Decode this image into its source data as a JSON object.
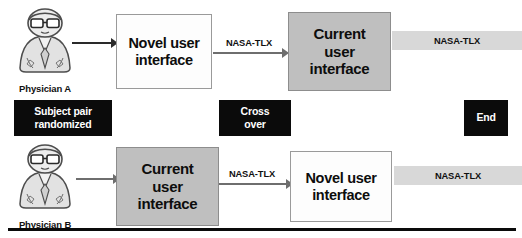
{
  "diagram": {
    "bottom_rule": true,
    "colors": {
      "shaded_box_fill": "#bfbfbf",
      "light_box_fill": "#fdfdfd",
      "box_border": "#9a9a9a",
      "black_box_fill": "#0b0b0b",
      "black_box_text": "#ffffff",
      "band_fill": "#d8d8d8",
      "arrow": "#6e6e6e",
      "rule": "#0a0a0a"
    }
  },
  "arm_a": {
    "person_label": "Physician A",
    "person_icon": "physician-avatar-icon",
    "step1": "Novel user\ninterface",
    "step1_line1": "Novel user",
    "step1_line2": "interface",
    "step1_style": "light",
    "measure1": "NASA-TLX",
    "step2_line1": "Current",
    "step2_line2": "user",
    "step2_line3": "interface",
    "step2_style": "shaded",
    "measure2": "NASA-TLX"
  },
  "arm_b": {
    "person_label": "Physician B",
    "person_icon": "physician-avatar-icon",
    "step1_line1": "Current",
    "step1_line2": "user",
    "step1_line3": "interface",
    "step1_style": "shaded",
    "measure1": "NASA-TLX",
    "step2_line1": "Novel user",
    "step2_line2": "interface",
    "step2_style": "light",
    "measure2": "NASA-TLX"
  },
  "controls": {
    "randomization_line1": "Subject pair",
    "randomization_line2": "randomized",
    "crossover_line1": "Cross",
    "crossover_line2": "over",
    "end": "End"
  }
}
